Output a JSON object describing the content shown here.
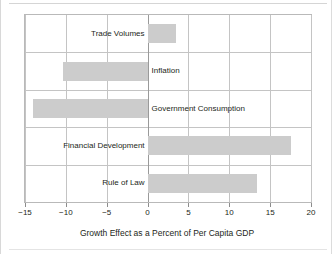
{
  "chart_data": {
    "type": "bar",
    "orientation": "horizontal",
    "title": "",
    "xlabel": "Growth Effect as a Percent of Per Capita GDP",
    "ylabel": "",
    "xlim": [
      -15,
      20
    ],
    "xticks": [
      -15,
      -10,
      -5,
      0,
      5,
      10,
      15,
      20
    ],
    "xtick_labels": [
      "−15",
      "−10",
      "−5",
      "0",
      "5",
      "10",
      "15",
      "20"
    ],
    "grid": true,
    "legend": false,
    "bar_color": "#cccccc",
    "categories": [
      "Trade Volumes",
      "Inflation",
      "Government Consumption",
      "Financial Development",
      "Rule of Law"
    ],
    "values": [
      3.5,
      -10.4,
      -14.0,
      17.6,
      13.4
    ]
  },
  "axis": {
    "title": "Growth Effect as a Percent of Per Capita GDP"
  }
}
